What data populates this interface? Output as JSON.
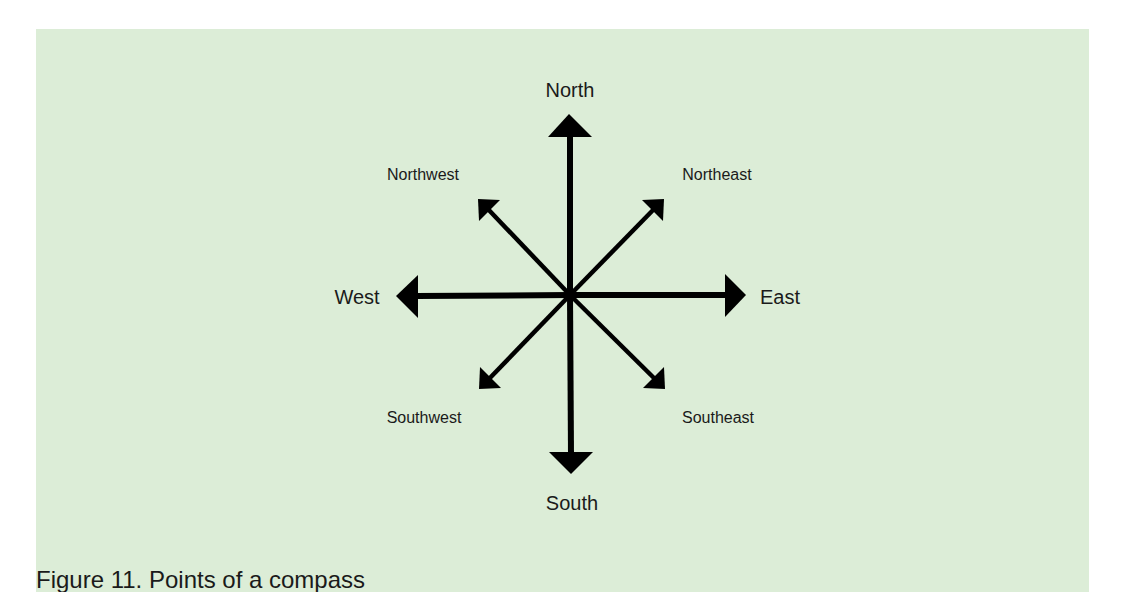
{
  "figure": {
    "caption": "Figure 11. Points of a compass",
    "background_color": "#dcedd7",
    "arrow_color": "#000000",
    "center": {
      "x": 570,
      "y": 295
    },
    "labels": {
      "north": "North",
      "northeast": "Northeast",
      "east": "East",
      "southeast": "Southeast",
      "south": "South",
      "southwest": "Southwest",
      "west": "West",
      "northwest": "Northwest"
    },
    "directions": [
      {
        "key": "north",
        "label": "North",
        "angle_deg": 0,
        "type": "cardinal"
      },
      {
        "key": "northeast",
        "label": "Northeast",
        "angle_deg": 45,
        "type": "intercardinal"
      },
      {
        "key": "east",
        "label": "East",
        "angle_deg": 90,
        "type": "cardinal"
      },
      {
        "key": "southeast",
        "label": "Southeast",
        "angle_deg": 135,
        "type": "intercardinal"
      },
      {
        "key": "south",
        "label": "South",
        "angle_deg": 180,
        "type": "cardinal"
      },
      {
        "key": "southwest",
        "label": "Southwest",
        "angle_deg": 225,
        "type": "intercardinal"
      },
      {
        "key": "west",
        "label": "West",
        "angle_deg": 270,
        "type": "cardinal"
      },
      {
        "key": "northwest",
        "label": "Northwest",
        "angle_deg": 315,
        "type": "intercardinal"
      }
    ]
  }
}
